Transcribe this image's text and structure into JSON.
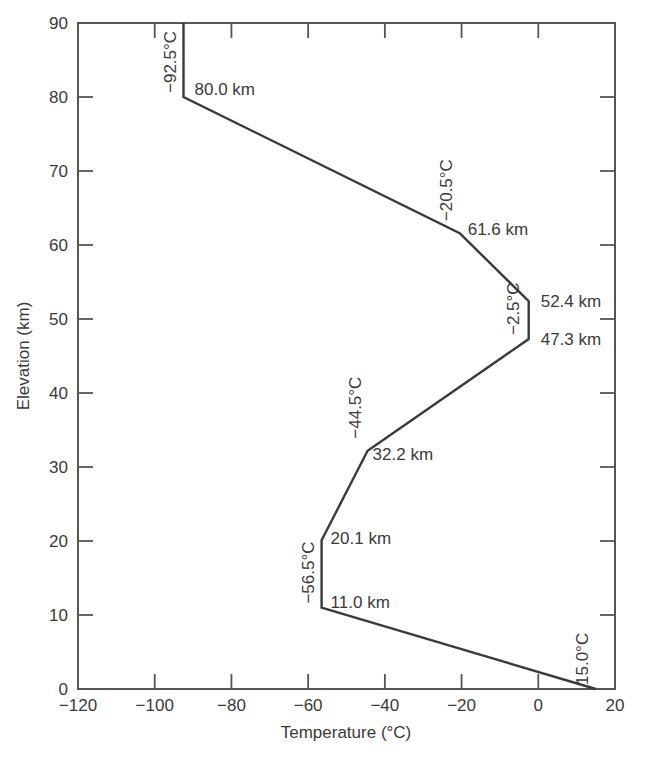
{
  "chart_data": {
    "type": "line",
    "title": "",
    "xlabel": "Temperature (°C)",
    "ylabel": "Elevation (km)",
    "xlim": [
      -120,
      20
    ],
    "ylim": [
      0,
      90
    ],
    "xticks": [
      -120,
      -100,
      -80,
      -60,
      -40,
      -20,
      0,
      20
    ],
    "yticks": [
      0,
      10,
      20,
      30,
      40,
      50,
      60,
      70,
      80,
      90
    ],
    "grid": false,
    "legend": null,
    "series": [
      {
        "name": "Standard atmosphere temperature profile",
        "points": [
          {
            "x": 15.0,
            "y": 0.0
          },
          {
            "x": -56.5,
            "y": 11.0
          },
          {
            "x": -56.5,
            "y": 20.1
          },
          {
            "x": -44.5,
            "y": 32.2
          },
          {
            "x": -2.5,
            "y": 47.3
          },
          {
            "x": -2.5,
            "y": 52.4
          },
          {
            "x": -20.5,
            "y": 61.6
          },
          {
            "x": -92.5,
            "y": 80.0
          },
          {
            "x": -92.5,
            "y": 90.0
          }
        ]
      }
    ],
    "annotations": {
      "temperatures": [
        {
          "text": "15.0°C",
          "x": 15.0,
          "y": 0.0
        },
        {
          "text": "−56.5°C",
          "x": -56.5,
          "y": 11.0
        },
        {
          "text": "−44.5°C",
          "x": -44.5,
          "y": 32.2
        },
        {
          "text": "−2.5°C",
          "x": -2.5,
          "y": 47.3
        },
        {
          "text": "−20.5°C",
          "x": -20.5,
          "y": 61.6
        },
        {
          "text": "−92.5°C",
          "x": -92.5,
          "y": 80.0
        }
      ],
      "elevations": [
        {
          "text": "11.0 km",
          "x": -56.5,
          "y": 11.0
        },
        {
          "text": "20.1 km",
          "x": -56.5,
          "y": 20.1
        },
        {
          "text": "32.2 km",
          "x": -44.5,
          "y": 32.2
        },
        {
          "text": "47.3 km",
          "x": -2.5,
          "y": 47.3
        },
        {
          "text": "52.4 km",
          "x": -2.5,
          "y": 52.4
        },
        {
          "text": "61.6 km",
          "x": -20.5,
          "y": 61.6
        },
        {
          "text": "80.0 km",
          "x": -92.5,
          "y": 80.0
        }
      ]
    }
  },
  "colors": {
    "axis": "#555555",
    "line": "#3a3a3a",
    "text": "#3a3a3a"
  }
}
